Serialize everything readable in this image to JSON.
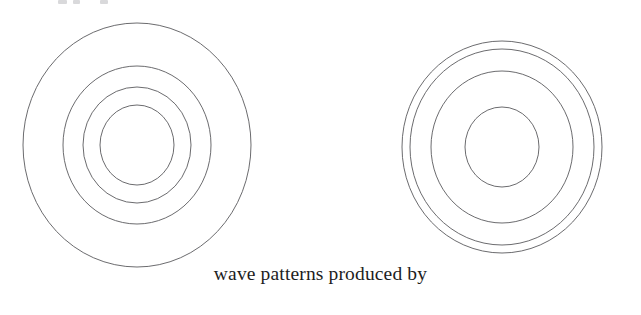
{
  "figure": {
    "caption": "wave patterns produced by",
    "background_color": "#ffffff",
    "stroke_color": "#5a5a5e",
    "stroke_width": 0.9,
    "groups": [
      {
        "name": "left-wave-pattern",
        "label": "left concentric wave rings",
        "center_x": 137,
        "center_y": 145,
        "ring_count": 4,
        "rings": [
          {
            "name": "ring-outer",
            "rx": 114,
            "ry": 122
          },
          {
            "name": "ring-third",
            "rx": 74,
            "ry": 79
          },
          {
            "name": "ring-second",
            "rx": 54,
            "ry": 58
          },
          {
            "name": "ring-inner",
            "rx": 37,
            "ry": 40
          }
        ]
      },
      {
        "name": "right-wave-pattern",
        "label": "right concentric wave rings",
        "center_x": 502,
        "center_y": 147,
        "ring_count": 4,
        "rings": [
          {
            "name": "ring-outer",
            "rx": 100,
            "ry": 106
          },
          {
            "name": "ring-third",
            "rx": 92,
            "ry": 98
          },
          {
            "name": "ring-second",
            "rx": 71,
            "ry": 76
          },
          {
            "name": "ring-inner",
            "rx": 37,
            "ry": 40
          }
        ]
      }
    ],
    "top_edge_remnants": [
      {
        "x": 58,
        "width": 9
      },
      {
        "x": 73,
        "width": 7
      },
      {
        "x": 100,
        "width": 8
      }
    ]
  }
}
